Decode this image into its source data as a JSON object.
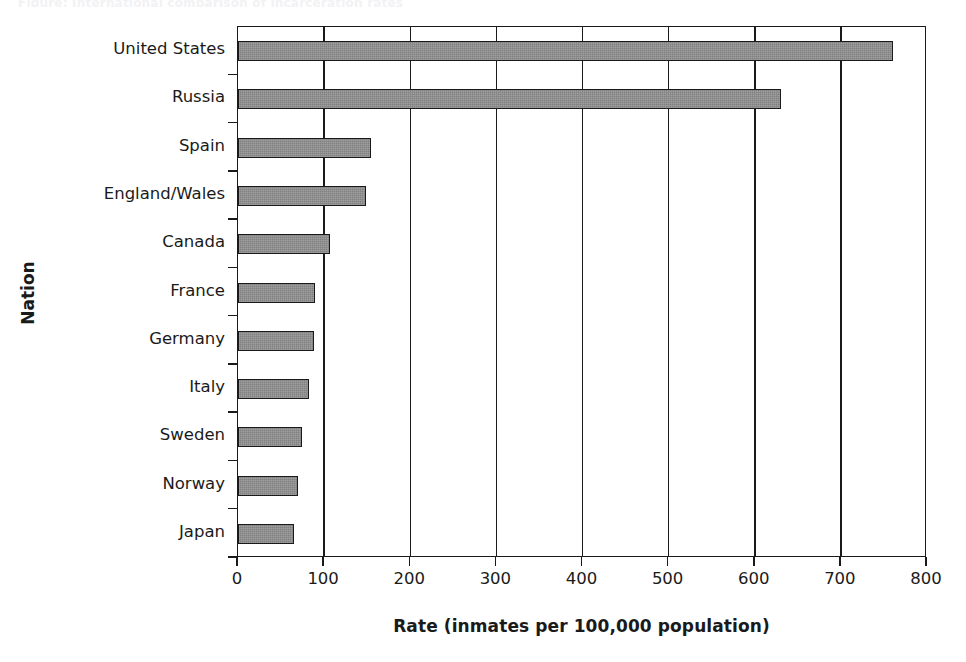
{
  "caption_remnant": "Figure: International comparison of incarceration rates",
  "chart_data": {
    "type": "bar",
    "orientation": "horizontal",
    "title": "",
    "xlabel": "Rate (inmates per 100,000 population)",
    "ylabel": "Nation",
    "categories": [
      "United States",
      "Russia",
      "Spain",
      "England/Wales",
      "Canada",
      "France",
      "Germany",
      "Italy",
      "Sweden",
      "Norway",
      "Japan"
    ],
    "values": [
      760,
      630,
      154,
      149,
      107,
      89,
      88,
      83,
      74,
      70,
      65
    ],
    "xlim": [
      0,
      800
    ],
    "xticks": [
      0,
      100,
      200,
      300,
      400,
      500,
      600,
      700,
      800
    ],
    "xticklabels": [
      "0",
      "100",
      "200",
      "300",
      "400",
      "500",
      "600",
      "700",
      "800"
    ],
    "grid": "vertical-only",
    "legend": "none",
    "bar_color": "#808080",
    "bar_edge_color": "#1a1a1a",
    "axis_color": "#1a1a1a",
    "background": "#ffffff"
  }
}
